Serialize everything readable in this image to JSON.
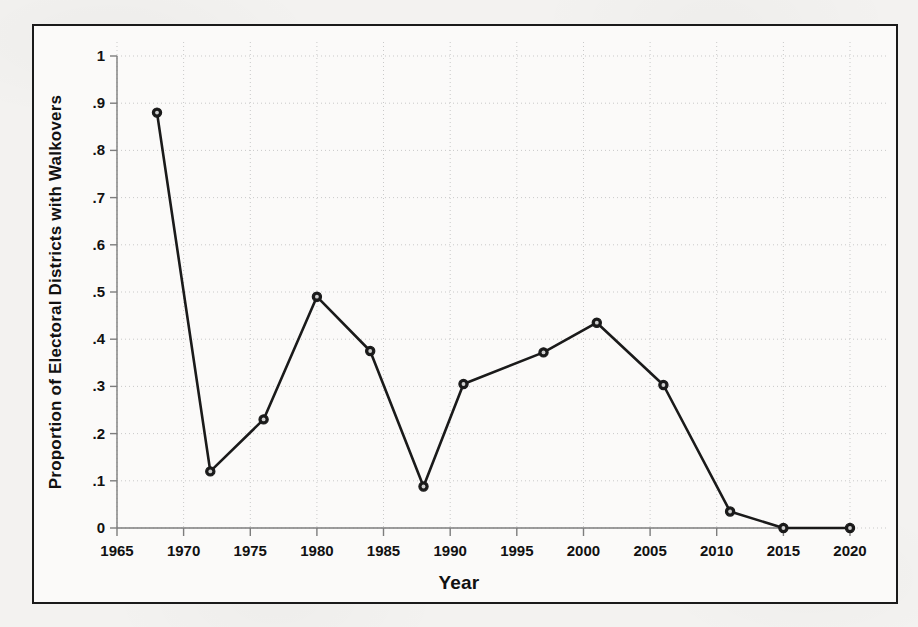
{
  "figure": {
    "background_color": "#fbfaf9",
    "frame_color": "#1a1a1a",
    "line_color": "#1a1a1a",
    "marker_fill": "#1a1a1a",
    "gridline_color": "#c9c9c9"
  },
  "chart_data": {
    "type": "line",
    "title": "",
    "subtitle": "",
    "xlabel": "Year",
    "ylabel": "Proportion of Electoral Districts with Walkovers",
    "xlim": [
      1965,
      2020
    ],
    "ylim": [
      0,
      1
    ],
    "grid": true,
    "legend": "none",
    "xticks": [
      1965,
      1970,
      1975,
      1980,
      1985,
      1990,
      1995,
      2000,
      2005,
      2010,
      2015,
      2020
    ],
    "xticklabels": [
      "1965",
      "1970",
      "1975",
      "1980",
      "1985",
      "1990",
      "1995",
      "2000",
      "2005",
      "2010",
      "2015",
      "2020"
    ],
    "yticks": [
      0,
      0.1,
      0.2,
      0.3,
      0.4,
      0.5,
      0.6,
      0.7,
      0.8,
      0.9,
      1
    ],
    "yticklabels": [
      "0",
      ".1",
      ".2",
      ".3",
      ".4",
      ".5",
      ".6",
      ".7",
      ".8",
      ".9",
      "1"
    ],
    "marker": "circle",
    "series": [
      {
        "name": "Proportion of Electoral Districts with Walkovers",
        "x": [
          1968,
          1972,
          1976,
          1980,
          1984,
          1988,
          1991,
          1997,
          2001,
          2006,
          2011,
          2015,
          2020
        ],
        "values": [
          0.88,
          0.12,
          0.23,
          0.49,
          0.375,
          0.088,
          0.305,
          0.372,
          0.435,
          0.303,
          0.035,
          0.0,
          0.0
        ]
      }
    ]
  }
}
